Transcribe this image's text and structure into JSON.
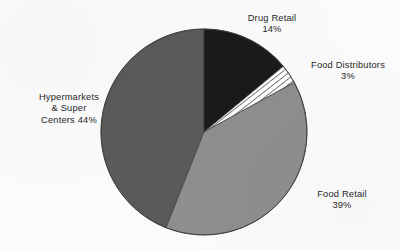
{
  "chart_data": {
    "type": "pie",
    "title": "",
    "subtitle": "",
    "xlabel": "",
    "ylabel": "",
    "legend_position": "none",
    "grid": false,
    "units": "percent",
    "start_angle_deg": 0,
    "direction": "clockwise",
    "categories": [
      "Drug Retail",
      "Food Distributors",
      "Food Retail",
      "Hypermarkets & Super Centers"
    ],
    "values": [
      14,
      3,
      39,
      44
    ],
    "slices": [
      {
        "name": "Drug Retail",
        "value": 14,
        "value_label": "14%",
        "label_lines": [
          "Drug Retail",
          "14%"
        ],
        "fill": "#1a1a1a",
        "fill_style": "solid"
      },
      {
        "name": "Food Distributors",
        "value": 3,
        "value_label": "3%",
        "label_lines": [
          "Food Distributors",
          "3%"
        ],
        "fill": "#ffffff",
        "fill_style": "diagonal-hatch"
      },
      {
        "name": "Food Retail",
        "value": 39,
        "value_label": "39%",
        "label_lines": [
          "Food Retail",
          "39%"
        ],
        "fill": "#8e8e8e",
        "fill_style": "solid"
      },
      {
        "name": "Hypermarkets & Super Centers",
        "value": 44,
        "value_label": "44%",
        "label_lines": [
          "Hypermarkets",
          "& Super",
          "Centers 44%"
        ],
        "fill": "#5a5a5a",
        "fill_style": "solid"
      }
    ]
  },
  "labels": {
    "drug_retail": "Drug Retail\n14%",
    "food_distributors": "Food Distributors\n3%",
    "food_retail": "Food Retail\n39%",
    "hypermarkets": "Hypermarkets\n& Super\nCenters 44%"
  },
  "colors": {
    "background": "#fbfbfb",
    "text": "#262626",
    "outline": "#3c3c3c",
    "drug_retail": "#1a1a1a",
    "food_distributors": "#ffffff",
    "food_retail": "#8e8e8e",
    "hypermarkets": "#5a5a5a",
    "hatch_stripe": "#2e2e2e"
  }
}
